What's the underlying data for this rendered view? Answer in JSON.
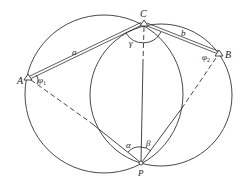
{
  "diagram": {
    "type": "geometry-resection",
    "points": {
      "A": {
        "label": "A",
        "x": 28,
        "y": 78
      },
      "B": {
        "label": "B",
        "x": 219,
        "y": 54
      },
      "C": {
        "label": "C",
        "x": 144,
        "y": 24
      },
      "P": {
        "label": "P",
        "x": 141,
        "y": 164
      }
    },
    "circles": [
      {
        "name": "circle-through-A-C-P",
        "cx": 104,
        "cy": 94,
        "r": 79
      },
      {
        "name": "circle-through-C-B-P",
        "cx": 161,
        "cy": 95,
        "r": 71
      }
    ],
    "segments": {
      "a": {
        "label": "a",
        "from": "A",
        "to": "C",
        "style": "double"
      },
      "b": {
        "label": "b",
        "from": "C",
        "to": "B",
        "style": "double"
      }
    },
    "angles": {
      "gamma": {
        "label": "γ",
        "at": "C"
      },
      "alpha": {
        "label": "α",
        "at": "P"
      },
      "beta": {
        "label": "β",
        "at": "P"
      },
      "phi1": {
        "label": "φ",
        "sub": "1",
        "at": "A"
      },
      "phi2": {
        "label": "φ",
        "sub": "2",
        "at": "B"
      }
    },
    "stroke_color": "#333333"
  }
}
